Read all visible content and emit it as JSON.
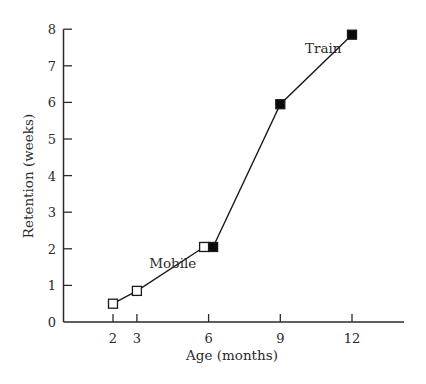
{
  "chart_data": {
    "type": "line",
    "title": "",
    "xlabel": "Age (months)",
    "ylabel": "Retention (weeks)",
    "xlim": [
      0,
      14.6
    ],
    "ylim": [
      0,
      8
    ],
    "grid": false,
    "legend": "none (inline annotations)",
    "x_ticks": [
      2,
      3,
      6,
      9,
      12
    ],
    "y_ticks": [
      0,
      1,
      2,
      3,
      4,
      5,
      6,
      7,
      8
    ],
    "series": [
      {
        "name": "Mobile",
        "marker": "open-square",
        "x": [
          2,
          3,
          6
        ],
        "values": [
          0.5,
          0.85,
          2.05
        ]
      },
      {
        "name": "Train",
        "marker": "filled-square",
        "x": [
          6,
          9,
          12
        ],
        "values": [
          2.05,
          5.95,
          7.85
        ]
      }
    ],
    "annotations": [
      {
        "text": "Mobile",
        "x": 4.5,
        "y": 1.6
      },
      {
        "text": "Train",
        "x": 10.8,
        "y": 7.5
      }
    ]
  },
  "colors": {
    "axis": "#2a2a2a",
    "line": "#1a1a1a",
    "marker_fill": "#0a0a0a",
    "marker_open_fill": "#ffffff",
    "background": "#ffffff"
  }
}
